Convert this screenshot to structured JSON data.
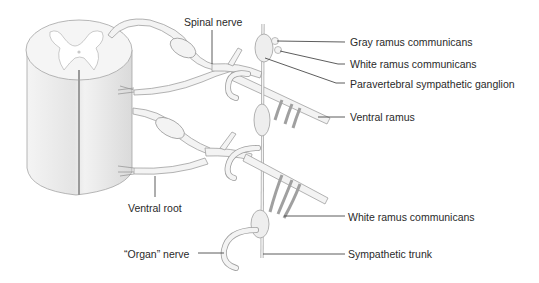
{
  "labels": {
    "spinal_nerve": "Spinal nerve",
    "gray_ramus": "Gray ramus communicans",
    "white_ramus_top": "White ramus communicans",
    "paravertebral_ganglion": "Paravertebral sympathetic ganglion",
    "ventral_ramus": "Ventral ramus",
    "ventral_root": "Ventral root",
    "white_ramus_bottom": "White ramus communicans",
    "organ_nerve": "“Organ” nerve",
    "sympathetic_trunk": "Sympathetic trunk"
  },
  "colors": {
    "tissue_fill": "#f2f2f2",
    "tissue_stroke": "#9a9a9a",
    "shade": "#dcdcdc",
    "leader": "#333333",
    "text": "#2a2a2a"
  }
}
